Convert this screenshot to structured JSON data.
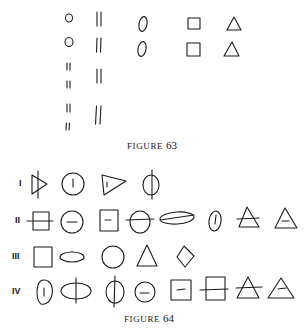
{
  "figure63": {
    "caption_word": "FIGURE",
    "caption_number": "63",
    "columns": [
      {
        "shape": "circle",
        "items": [
          "circle",
          "circle",
          "double-bar",
          "double-bar",
          "double-bar",
          "double-bar"
        ]
      },
      {
        "shape": "double-bar",
        "items": [
          "double-bar",
          "double-bar",
          "double-bar",
          "double-bar"
        ]
      },
      {
        "shape": "oval",
        "items": [
          "oval",
          "oval"
        ]
      },
      {
        "shape": "square",
        "items": [
          "square",
          "square"
        ]
      },
      {
        "shape": "triangle",
        "items": [
          "triangle",
          "triangle"
        ]
      }
    ]
  },
  "figure64": {
    "caption_word": "FIGURE",
    "caption_number": "64",
    "rows": [
      {
        "label": "I",
        "shapes": [
          "triangle-pointing-right-with-vertical-line",
          "circle-with-vertical-dash",
          "triangle-pointing-right-with-vertical-dash",
          "oval-with-vertical-line"
        ]
      },
      {
        "label": "II",
        "shapes": [
          "square-with-horizontal-line",
          "circle-with-horizontal-dash",
          "square-with-horizontal-dash",
          "circle-with-horizontal-line",
          "ellipse-with-horizontal-line",
          "oval-with-vertical-dash",
          "triangle-with-horizontal-line",
          "triangle-with-horizontal-dash"
        ]
      },
      {
        "label": "III",
        "shapes": [
          "square",
          "ellipse",
          "circle",
          "triangle",
          "diamond"
        ]
      },
      {
        "label": "IV",
        "shapes": [
          "oval-with-vertical-dash",
          "ellipse-with-vertical-line",
          "oval-with-vertical-line",
          "circle-with-horizontal-dash",
          "square-with-horizontal-dash",
          "square-with-horizontal-line",
          "triangle-with-horizontal-line",
          "triangle-with-horizontal-dash"
        ]
      }
    ]
  },
  "colors": {
    "ink": "#1a1a1a",
    "paper": "#ffffff"
  }
}
